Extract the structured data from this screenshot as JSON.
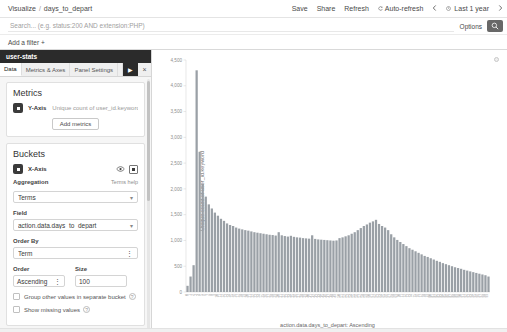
{
  "topbar": {
    "breadcrumb_root": "Visualize",
    "breadcrumb_sep": "/",
    "breadcrumb_current": "days_to_depart",
    "save_label": "Save",
    "share_label": "Share",
    "refresh_label": "Refresh",
    "autorefresh_label": "Auto-refresh",
    "autorefresh_icon": "refresh-icon",
    "prev_icon": "chevron-left-icon",
    "next_icon": "chevron-right-icon",
    "clock_icon": "clock-icon",
    "time_range": "Last 1 year"
  },
  "query": {
    "placeholder": "Search... (e.g. status:200 AND extension:PHP)",
    "value": "",
    "options_label": "Options",
    "search_icon": "search-icon"
  },
  "filters": {
    "add_filter_label": "Add a filter",
    "add_filter_plus": "+"
  },
  "sidebar": {
    "panel_title": "user-stats",
    "tabs": [
      {
        "label": "Data",
        "active": true
      },
      {
        "label": "Metrics & Axes",
        "active": false
      },
      {
        "label": "Panel Settings",
        "active": false
      }
    ],
    "apply_icon": "play-icon",
    "apply_label": "▶",
    "close_icon": "close-icon",
    "close_label": "×",
    "metrics": {
      "heading": "Metrics",
      "agg_icon": "collapse-icon",
      "y_axis_label": "Y-Axis",
      "y_axis_value": "Unique count of user_id.keyword",
      "add_metrics_label": "Add metrics"
    },
    "buckets": {
      "heading": "Buckets",
      "agg_icon": "collapse-icon",
      "x_axis_label": "X-Axis",
      "eye_icon": "eye-icon",
      "remove_icon": "remove-bucket-icon",
      "aggregation_label": "Aggregation",
      "terms_help_label": "Terms help",
      "aggregation_value": "Terms",
      "field_label": "Field",
      "field_value": "action.data.days_to_depart",
      "order_by_label": "Order By",
      "order_by_value": "Term",
      "order_label": "Order",
      "order_value": "Ascending",
      "size_label": "Size",
      "size_value": "100",
      "group_other_label": "Group other values in separate bucket",
      "show_missing_label": "Show missing values",
      "help_glyph": "?"
    }
  },
  "chart_panel": {
    "gear_icon": "gear-icon"
  },
  "chart_data": {
    "type": "bar",
    "title": "",
    "xlabel": "action.data.days_to_depart: Ascending",
    "ylabel": "Unique count of user_id.keyword",
    "ylim": [
      0,
      4500
    ],
    "yticks": [
      0,
      500,
      1000,
      1500,
      2000,
      2500,
      3000,
      3500,
      4000,
      4500
    ],
    "ytick_labels": [
      "0",
      "500",
      "1,000",
      "1,500",
      "2,000",
      "2,500",
      "3,000",
      "3,500",
      "4,000",
      "4,500"
    ],
    "grid": false,
    "legend": "none",
    "series_name": "Unique count of user_id.keyword",
    "bar_color": "#9aa0a6",
    "categories": [
      "0",
      "1",
      "2",
      "3",
      "4",
      "5",
      "6",
      "7",
      "8",
      "9",
      "10",
      "11",
      "12",
      "13",
      "14",
      "15",
      "16",
      "17",
      "18",
      "19",
      "20",
      "21",
      "22",
      "23",
      "24",
      "25",
      "26",
      "27",
      "28",
      "29",
      "30",
      "31",
      "32",
      "33",
      "34",
      "35",
      "36",
      "37",
      "38",
      "39",
      "40",
      "41",
      "42",
      "43",
      "44",
      "45",
      "46",
      "47",
      "48",
      "49",
      "50",
      "51",
      "52",
      "53",
      "54",
      "55",
      "56",
      "57",
      "58",
      "59",
      "60",
      "61",
      "62",
      "63",
      "64",
      "65",
      "66",
      "67",
      "68",
      "69",
      "70",
      "71",
      "72",
      "73",
      "74",
      "75",
      "76",
      "77",
      "78",
      "79",
      "80",
      "81",
      "82",
      "83",
      "84",
      "85",
      "86",
      "87",
      "88",
      "89",
      "90",
      "91",
      "92",
      "93",
      "94",
      "95",
      "96",
      "97",
      "98",
      "99"
    ],
    "values": [
      120,
      300,
      520,
      4300,
      2720,
      2100,
      1850,
      1700,
      1620,
      1540,
      1480,
      1420,
      1380,
      1330,
      1300,
      1280,
      1250,
      1230,
      1215,
      1200,
      1190,
      1175,
      1160,
      1150,
      1140,
      1130,
      1120,
      1110,
      1105,
      1095,
      1160,
      1100,
      1085,
      1075,
      1090,
      1070,
      1060,
      1055,
      1045,
      1040,
      1035,
      1100,
      1030,
      1020,
      1015,
      1010,
      1005,
      1000,
      995,
      1000,
      1045,
      1060,
      1080,
      1100,
      1130,
      1160,
      1200,
      1240,
      1280,
      1310,
      1345,
      1370,
      1400,
      1320,
      1280,
      1250,
      1200,
      1120,
      1060,
      1010,
      970,
      930,
      890,
      850,
      820,
      790,
      760,
      730,
      700,
      680,
      655,
      630,
      605,
      585,
      560,
      540,
      520,
      500,
      480,
      465,
      450,
      430,
      415,
      400,
      385,
      370,
      355,
      340,
      325,
      300
    ]
  }
}
